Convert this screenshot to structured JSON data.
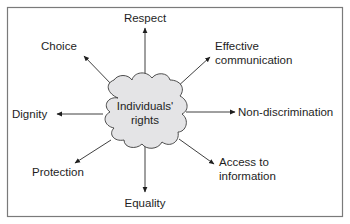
{
  "diagram": {
    "type": "spider-diagram",
    "center": {
      "line1": "Individuals'",
      "line2": "rights"
    },
    "branches": {
      "respect": "Respect",
      "choice": "Choice",
      "effective_communication_line1": "Effective",
      "effective_communication_line2": "communication",
      "dignity": "Dignity",
      "non_discrimination": "Non-discrimination",
      "protection": "Protection",
      "access_to_information_line1": "Access to",
      "access_to_information_line2": "information",
      "equality": "Equality"
    },
    "colors": {
      "cloud_fill": "#e4e4e6",
      "line": "#2a2a2a",
      "frame": "#7a7a7a",
      "text": "#1e1e1e"
    }
  }
}
